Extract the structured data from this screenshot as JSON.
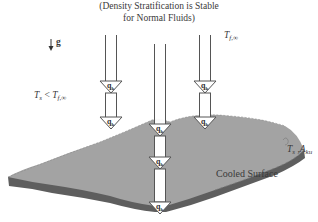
{
  "title": {
    "line1": "(Density Stratification is Stable",
    "line2": "for Normal Fluids)"
  },
  "gravity": {
    "symbol": "g"
  },
  "labels": {
    "fluid_temperature": {
      "main": "T",
      "sub": "f,∞"
    },
    "condition": {
      "left": "T",
      "left_sub": "s",
      "op": " < ",
      "right": "T",
      "right_sub": "f,∞"
    },
    "surface_props": {
      "t": "T",
      "t_sub": "s",
      "sep": " ,",
      "a": "A",
      "a_sub": "ku"
    },
    "surface_name": "Cooled Surface"
  },
  "arrows": [
    {
      "id": "left",
      "heads": [
        "q_k",
        "q_k"
      ]
    },
    {
      "id": "center",
      "heads": [
        "q_k",
        "q_k",
        "q_k"
      ]
    },
    {
      "id": "right",
      "heads": [
        "q_k",
        "q_k"
      ]
    }
  ],
  "arrow_label": "q",
  "arrow_label_sub": "k",
  "colors": {
    "surface_top": "#a3a3a3",
    "surface_edge": "#5e5e5e",
    "arrow_stroke": "#555555",
    "arrow_fill": "#ffffff"
  }
}
